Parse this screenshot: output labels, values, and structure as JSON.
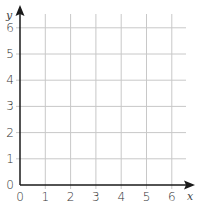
{
  "chart_data": {
    "type": "line",
    "title": "",
    "xlabel": "x",
    "ylabel": "y",
    "xlim": [
      0,
      6
    ],
    "ylim": [
      0,
      6
    ],
    "x_ticks": [
      "0",
      "1",
      "2",
      "3",
      "4",
      "5",
      "6"
    ],
    "y_ticks": [
      "0",
      "1",
      "2",
      "3",
      "4",
      "5",
      "6"
    ],
    "grid": true,
    "series": []
  },
  "colors": {
    "axis": "#1a1a1a",
    "grid": "#c8c8c8",
    "text": "#333333"
  }
}
